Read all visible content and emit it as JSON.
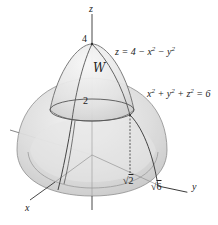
{
  "diagram": {
    "type": "3d-region",
    "axes": {
      "x_label": "x",
      "y_label": "y",
      "z_label": "z"
    },
    "surfaces": [
      {
        "name": "paraboloid",
        "equation_label": "z = 4 − x² − y²",
        "eq_parts": [
          "z = 4 − x",
          "2",
          " − y",
          "2"
        ]
      },
      {
        "name": "sphere",
        "equation_label": "x² + y² + z² = 6",
        "eq_parts": [
          "x",
          "2",
          " + y",
          "2",
          " + z",
          "2",
          " = 6"
        ]
      }
    ],
    "region_label": "W",
    "ticks": {
      "z_top": "4",
      "z_mid": "2",
      "y_inner": "√2",
      "y_inner_radicand": "2",
      "y_outer": "√6",
      "y_outer_radicand": "6",
      "radical": "√"
    },
    "colors": {
      "surface_fill": "#d9d9d9",
      "surface_light": "#ececec",
      "outline": "#555555",
      "axis": "#333333",
      "background": "#ffffff"
    }
  }
}
